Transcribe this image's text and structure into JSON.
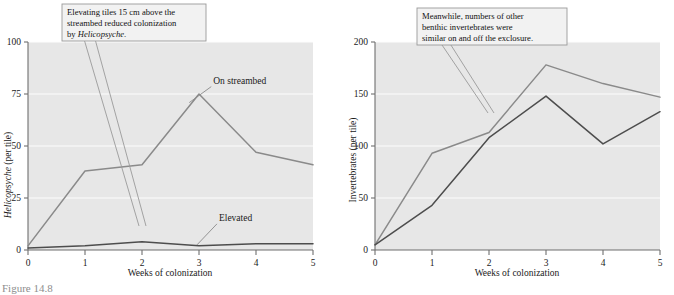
{
  "figure": {
    "caption": "Figure 14.8",
    "panels": [
      "left",
      "right"
    ]
  },
  "chart_data": [
    {
      "type": "line",
      "panel": "left",
      "title": "",
      "xlabel": "Weeks of colonization",
      "ylabel": "Helicopsyche (per tile)",
      "ylabel_italic_part": "Helicopsyche",
      "ylabel_plain_part": " (per tile)",
      "x": [
        0,
        1,
        2,
        3,
        4,
        5
      ],
      "xtick_labels": [
        "0",
        "1",
        "2",
        "3",
        "4",
        "5"
      ],
      "ytick_labels": [
        "0",
        "25",
        "50",
        "75",
        "100"
      ],
      "yticks": [
        0,
        25,
        50,
        75,
        100
      ],
      "xlim": [
        0,
        5
      ],
      "ylim": [
        0,
        100
      ],
      "grid": "horizontal-white",
      "legend_position": "inline-annotations",
      "series": [
        {
          "name": "On streambed",
          "color": "#8a8a8a",
          "values": [
            2,
            38,
            41,
            75,
            47,
            41
          ]
        },
        {
          "name": "Elevated",
          "color": "#4d4d4d",
          "values": [
            1,
            2,
            4,
            2,
            3,
            3
          ]
        }
      ],
      "annotations": [
        {
          "text": "On streambed",
          "x": 3.25,
          "y": 80
        },
        {
          "text": "Elevated",
          "x": 3.35,
          "y": 14
        }
      ],
      "callout": {
        "lines": [
          {
            "plain_before": "Elevating tiles 15 cm above the",
            "italic": "",
            "plain_after": ""
          },
          {
            "plain_before": "streambed reduced colonization",
            "italic": "",
            "plain_after": ""
          },
          {
            "plain_before": "by ",
            "italic": "Helicopsyche",
            "plain_after": "."
          }
        ],
        "points_to_series": "On streambed"
      }
    },
    {
      "type": "line",
      "panel": "right",
      "title": "",
      "xlabel": "Weeks of colonization",
      "ylabel": "Invertebrates (per tile)",
      "x": [
        0,
        1,
        2,
        3,
        4,
        5
      ],
      "xtick_labels": [
        "0",
        "1",
        "2",
        "3",
        "4",
        "5"
      ],
      "ytick_labels": [
        "0",
        "50",
        "100",
        "150",
        "200"
      ],
      "yticks": [
        0,
        50,
        100,
        150,
        200
      ],
      "xlim": [
        0,
        5
      ],
      "ylim": [
        0,
        200
      ],
      "grid": "horizontal-white",
      "legend_position": "none",
      "series": [
        {
          "name": "On streambed",
          "color": "#8a8a8a",
          "values": [
            5,
            93,
            113,
            178,
            160,
            147
          ]
        },
        {
          "name": "Elevated",
          "color": "#4d4d4d",
          "values": [
            5,
            43,
            108,
            148,
            102,
            133
          ]
        }
      ],
      "annotations": [],
      "callout": {
        "lines": [
          {
            "plain_before": "Meanwhile, numbers of other",
            "italic": "",
            "plain_after": ""
          },
          {
            "plain_before": "benthic invertebrates were",
            "italic": "",
            "plain_after": ""
          },
          {
            "plain_before": "similar on and off the exclosure.",
            "italic": "",
            "plain_after": ""
          }
        ],
        "points_to_series": "Elevated"
      }
    }
  ]
}
